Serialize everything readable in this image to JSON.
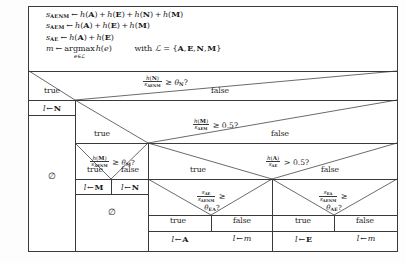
{
  "figure": {
    "kind": "decision-tree",
    "preamble": [
      {
        "id": "s-aenm",
        "lhs_var": "s",
        "lhs_sub": "AENM",
        "assign": "←",
        "rhs": "h(A) + h(E) + h(N) + h(M)"
      },
      {
        "id": "s-aem",
        "lhs_var": "s",
        "lhs_sub": "AEM",
        "assign": "←",
        "rhs": "h(A) + h(E) + h(M)"
      },
      {
        "id": "s-ae",
        "lhs_var": "s",
        "lhs_sub": "AE",
        "assign": "←",
        "rhs": "h(A) + h(E)"
      },
      {
        "id": "m-argmax",
        "lhs_var": "m",
        "lhs_sub": "",
        "assign": "←",
        "rhs": "argmax h(e)",
        "argmax_subscript": "e∈ℒ",
        "with_clause": "with ℒ = {A, E, N, M}"
      }
    ],
    "conditions": {
      "root": {
        "name": "theta-N-test",
        "num": "h(N)",
        "den": "s",
        "den_sub": "AENM",
        "cmp": "≥",
        "rhs": "θ",
        "rhs_sub": "N",
        "suffix": "?"
      },
      "level2": {
        "name": "m-half-test",
        "num": "h(M)",
        "den": "s",
        "den_sub": "AEM",
        "cmp": "≥",
        "rhs": "0.5",
        "rhs_sub": "",
        "suffix": "?"
      },
      "level3_left": {
        "name": "theta-M-test",
        "num": "h(M)",
        "den": "s",
        "den_sub": "AENM",
        "cmp": "≥",
        "rhs": "θ",
        "rhs_sub": "M",
        "suffix": "?"
      },
      "level3_right": {
        "name": "a-half-test",
        "num": "h(A)",
        "den": "s",
        "den_sub": "AE",
        "cmp": ">",
        "rhs": "0.5",
        "rhs_sub": "",
        "suffix": "?"
      },
      "level4_left": {
        "name": "theta-EA-test",
        "num": "s",
        "num_sub": "AE",
        "den": "s",
        "den_sub": "AENM",
        "cmp": "≥",
        "rhs": "θ",
        "rhs_sub": "EA",
        "suffix": "?"
      },
      "level4_right": {
        "name": "theta-AE-test",
        "num": "s",
        "num_sub": "EA",
        "den": "s",
        "den_sub": "AENM",
        "cmp": "≥",
        "rhs": "θ",
        "rhs_sub": "AE",
        "suffix": "?"
      }
    },
    "branch_labels": {
      "true": "true",
      "false": "false"
    },
    "branches": {
      "root_true": "true",
      "root_false": "false",
      "l2_true": "true",
      "l2_false": "false",
      "l3l_true": "true",
      "l3l_false": "false",
      "l3r_true": "true",
      "l3r_false": "false",
      "l4l_true": "true",
      "l4l_false": "false",
      "l4r_true": "true",
      "l4r_false": "false"
    },
    "leaves": [
      {
        "id": "leaf-n-root",
        "var": "l",
        "assign": "←",
        "value": "N",
        "bold": true
      },
      {
        "id": "leaf-m",
        "var": "l",
        "assign": "←",
        "value": "M",
        "bold": true
      },
      {
        "id": "leaf-n",
        "var": "l",
        "assign": "←",
        "value": "N",
        "bold": true
      },
      {
        "id": "leaf-a",
        "var": "l",
        "assign": "←",
        "value": "A",
        "bold": true
      },
      {
        "id": "leaf-m-var-1",
        "var": "l",
        "assign": "←",
        "value": "m",
        "bold": false
      },
      {
        "id": "leaf-e",
        "var": "l",
        "assign": "←",
        "value": "E",
        "bold": true
      },
      {
        "id": "leaf-m-var-2",
        "var": "l",
        "assign": "←",
        "value": "m",
        "bold": false
      }
    ],
    "emptysets": [
      {
        "id": "emptyset-left",
        "glyph": "∅"
      },
      {
        "id": "emptyset-middle",
        "glyph": "∅"
      }
    ],
    "colors": {
      "line": "#3a3a3a",
      "text": "#1a1a1a",
      "background": "#ffffff"
    }
  }
}
